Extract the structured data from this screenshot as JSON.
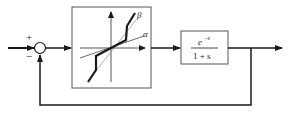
{
  "diagram": {
    "summing_junction": {
      "plus_sign": "+",
      "minus_sign": "−"
    },
    "nonlinearity_block": {
      "label_beta": "β",
      "label_alpha": "α"
    },
    "transfer_function_block": {
      "numerator": "e",
      "numerator_exponent": "−s",
      "denominator": "1 + s"
    },
    "colors": {
      "line": "#1a1a1a",
      "block_border": "#555555"
    }
  }
}
